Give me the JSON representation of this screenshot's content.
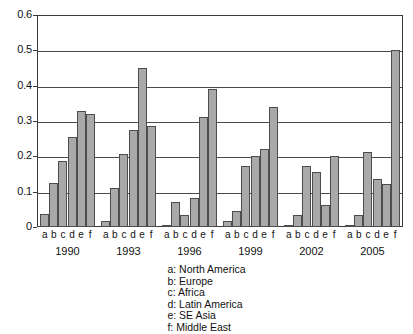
{
  "chart_data": {
    "type": "bar",
    "title": "",
    "subtitle": "",
    "xlabel": "",
    "ylabel": "",
    "ylim": [
      0,
      0.6
    ],
    "ytick_labels": [
      "0.6",
      "0.5",
      "0.4",
      "0.3",
      "0.2",
      "0.1",
      "0"
    ],
    "ytick_values": [
      0.6,
      0.5,
      0.4,
      0.3,
      0.2,
      0.1,
      0
    ],
    "grid": "horizontal",
    "legend_position": "below-center",
    "categories": [
      "1990",
      "1993",
      "1996",
      "1999",
      "2002",
      "2005"
    ],
    "subcategories": [
      "a",
      "b",
      "c",
      "d",
      "e",
      "f"
    ],
    "series": [
      {
        "name": "a",
        "label": "North America",
        "values": [
          0.038,
          0.017,
          0.006,
          0.018,
          0.006,
          0.007
        ]
      },
      {
        "name": "b",
        "label": "Europe",
        "values": [
          0.125,
          0.11,
          0.072,
          0.045,
          0.035,
          0.034
        ]
      },
      {
        "name": "c",
        "label": "Africa",
        "values": [
          0.188,
          0.208,
          0.034,
          0.173,
          0.173,
          0.212
        ]
      },
      {
        "name": "d",
        "label": "Latin America",
        "values": [
          0.255,
          0.275,
          0.083,
          0.2,
          0.157,
          0.136
        ]
      },
      {
        "name": "e",
        "label": "SE Asia",
        "values": [
          0.328,
          0.45,
          0.31,
          0.222,
          0.063,
          0.123
        ]
      },
      {
        "name": "f",
        "label": "Middle East",
        "values": [
          0.32,
          0.285,
          0.392,
          0.34,
          0.202,
          0.5
        ]
      }
    ],
    "legend_entries": [
      "a: North America",
      "b: Europe",
      "c: Africa",
      "d: Latin America",
      "e: SE Asia",
      "f: Middle East"
    ],
    "colors": {
      "bar_fill": "#a9a9a9",
      "bar_border": "#4d4d4d",
      "grid": "#4a4a4a",
      "axis": "#3a3a3a",
      "text": "#111111",
      "background": "#ffffff"
    }
  }
}
